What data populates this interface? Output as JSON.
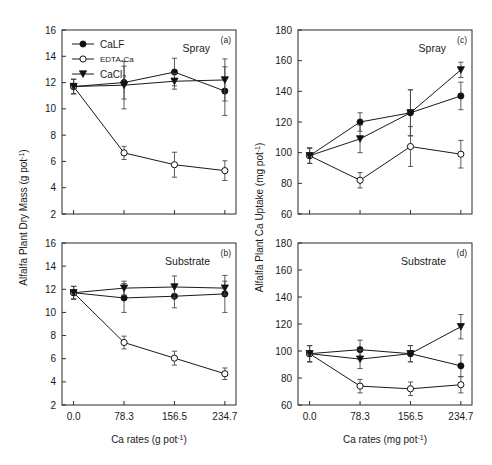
{
  "figure": {
    "legend": {
      "items": [
        {
          "label": "CaLF",
          "marker": "filled-circle"
        },
        {
          "label": "EDTA-Ca",
          "marker": "open-circle"
        },
        {
          "label": "CaCl2",
          "marker": "filled-triangle"
        }
      ],
      "calf_label": "CaLF",
      "edta_label": "EDTA-Ca",
      "cacl2_label_base": "CaCl",
      "cacl2_label_sub": "2"
    },
    "axis_titles": {
      "left_y_base": "Alfalfa Plant Dry Mass (g pot",
      "left_y_sup": "-1",
      "left_y_close": ")",
      "right_y_base": "Alfalfa Plant Ca Uptake (mg pot",
      "right_y_sup": "-1",
      "right_y_close": ")",
      "left_x_base": "Ca rates (g pot",
      "left_x_sup": "-1",
      "left_x_close": ")",
      "right_x_base": "Ca rates (mg pot",
      "right_x_sup": "-1",
      "right_x_close": ")"
    }
  },
  "chart_data": [
    {
      "panel": "a",
      "panel_label": "(a)",
      "title": "Spray",
      "type": "line",
      "x": [
        0.0,
        78.3,
        156.5,
        234.7
      ],
      "xticklabels": [
        "0.0",
        "78.3",
        "156.5",
        "234.7"
      ],
      "xlabel": "Ca rates (g pot-1)",
      "ylabel": "Alfalfa Plant Dry Mass (g pot-1)",
      "ylim": [
        2,
        16
      ],
      "yticks": [
        2,
        4,
        6,
        8,
        10,
        12,
        14,
        16
      ],
      "yticklabels": [
        "2",
        "4",
        "6",
        "8",
        "10",
        "12",
        "14",
        "16"
      ],
      "grid": false,
      "legend_position": "top-left",
      "series": [
        {
          "name": "CaLF",
          "marker": "filled-circle",
          "values": [
            11.7,
            12.0,
            12.8,
            11.35
          ],
          "errors": [
            0.55,
            1.25,
            1.05,
            1.85
          ]
        },
        {
          "name": "EDTA-Ca",
          "marker": "open-circle",
          "values": [
            11.7,
            6.65,
            5.75,
            5.3
          ],
          "errors": [
            0.55,
            0.5,
            0.95,
            0.75
          ]
        },
        {
          "name": "CaCl2",
          "marker": "filled-triangle",
          "values": [
            11.7,
            11.8,
            12.1,
            12.2
          ],
          "errors": [
            0.55,
            1.8,
            0.6,
            1.6
          ]
        }
      ]
    },
    {
      "panel": "b",
      "panel_label": "(b)",
      "title": "Substrate",
      "type": "line",
      "x": [
        0.0,
        78.3,
        156.5,
        234.7
      ],
      "xticklabels": [
        "0.0",
        "78.3",
        "156.5",
        "234.7"
      ],
      "xlabel": "Ca rates (g pot-1)",
      "ylabel": "Alfalfa Plant Dry Mass (g pot-1)",
      "ylim": [
        2,
        16
      ],
      "yticks": [
        2,
        4,
        6,
        8,
        10,
        12,
        14,
        16
      ],
      "yticklabels": [
        "2",
        "4",
        "6",
        "8",
        "10",
        "12",
        "14",
        "16"
      ],
      "grid": false,
      "series": [
        {
          "name": "CaLF",
          "marker": "filled-circle",
          "values": [
            11.7,
            11.25,
            11.4,
            11.6
          ],
          "errors": [
            0.55,
            1.25,
            1.0,
            1.6
          ]
        },
        {
          "name": "EDTA-Ca",
          "marker": "open-circle",
          "values": [
            11.7,
            7.4,
            6.05,
            4.7
          ],
          "errors": [
            0.55,
            0.55,
            0.6,
            0.5
          ]
        },
        {
          "name": "CaCl2",
          "marker": "filled-triangle",
          "values": [
            11.7,
            12.1,
            12.2,
            12.1
          ],
          "errors": [
            0.55,
            0.6,
            0.95,
            0.6
          ]
        }
      ]
    },
    {
      "panel": "c",
      "panel_label": "(c)",
      "title": "Spray",
      "type": "line",
      "x": [
        0.0,
        78.3,
        156.5,
        234.7
      ],
      "xticklabels": [
        "0.0",
        "78.3",
        "156.5",
        "234.7"
      ],
      "xlabel": "Ca rates (mg pot-1)",
      "ylabel": "Alfalfa Plant Ca Uptake (mg pot-1)",
      "ylim": [
        60,
        180
      ],
      "yticks": [
        60,
        80,
        100,
        120,
        140,
        160,
        180
      ],
      "yticklabels": [
        "60",
        "80",
        "100",
        "120",
        "140",
        "160",
        "180"
      ],
      "grid": false,
      "series": [
        {
          "name": "CaLF",
          "marker": "filled-circle",
          "values": [
            98,
            120,
            126,
            137
          ],
          "errors": [
            5,
            6,
            15,
            9
          ]
        },
        {
          "name": "EDTA-Ca",
          "marker": "open-circle",
          "values": [
            98,
            82,
            104,
            99
          ],
          "errors": [
            5,
            5,
            13,
            9
          ]
        },
        {
          "name": "CaCl2",
          "marker": "filled-triangle",
          "values": [
            98,
            109,
            126,
            154
          ],
          "errors": [
            5,
            9,
            15,
            5
          ]
        }
      ]
    },
    {
      "panel": "d",
      "panel_label": "(d)",
      "title": "Substrate",
      "type": "line",
      "x": [
        0.0,
        78.3,
        156.5,
        234.7
      ],
      "xticklabels": [
        "0.0",
        "78.3",
        "156.5",
        "234.7"
      ],
      "xlabel": "Ca rates (mg pot-1)",
      "ylabel": "Alfalfa Plant Ca Uptake (mg pot-1)",
      "ylim": [
        60,
        180
      ],
      "yticks": [
        60,
        80,
        100,
        120,
        140,
        160,
        180
      ],
      "yticklabels": [
        "60",
        "80",
        "100",
        "120",
        "140",
        "160",
        "180"
      ],
      "grid": false,
      "series": [
        {
          "name": "CaLF",
          "marker": "filled-circle",
          "values": [
            98,
            101,
            98,
            89
          ],
          "errors": [
            6,
            7,
            6,
            8
          ]
        },
        {
          "name": "EDTA-Ca",
          "marker": "open-circle",
          "values": [
            98,
            74,
            72,
            75
          ],
          "errors": [
            6,
            5,
            5,
            6
          ]
        },
        {
          "name": "CaCl2",
          "marker": "filled-triangle",
          "values": [
            98,
            94,
            98,
            118
          ],
          "errors": [
            6,
            7,
            6,
            9
          ]
        }
      ]
    }
  ]
}
